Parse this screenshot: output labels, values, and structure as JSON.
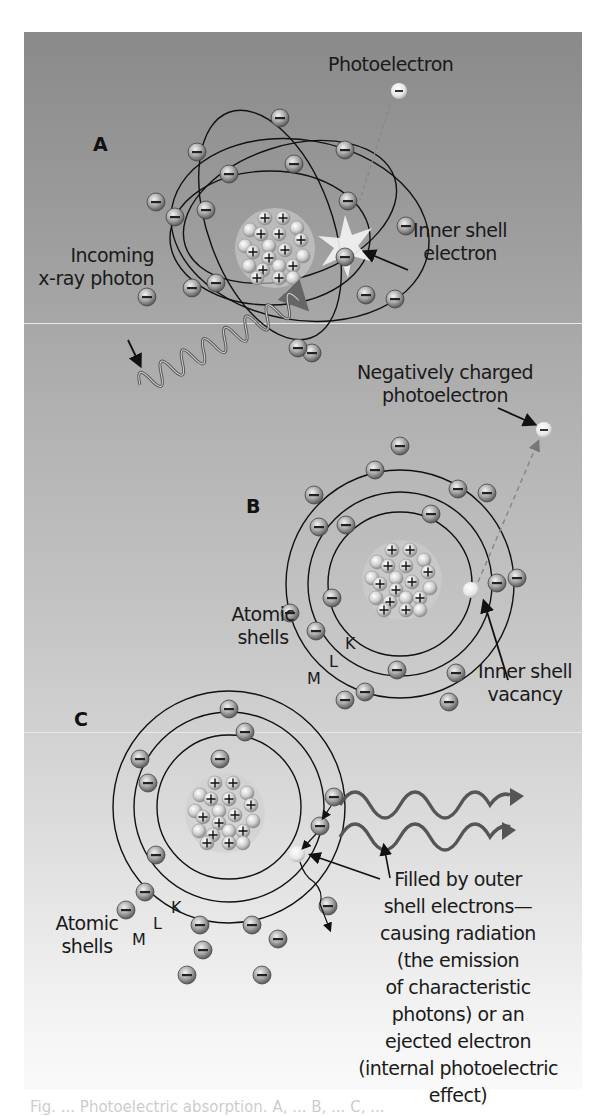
{
  "figure": {
    "panels": [
      {
        "id": "A",
        "labels": {
          "photoelectron": "Photoelectron",
          "inner_shell_electron": [
            "Inner shell",
            "electron"
          ],
          "incoming_photon": [
            "Incoming",
            "x-ray photon"
          ]
        }
      },
      {
        "id": "B",
        "labels": {
          "photoelectron": [
            "Negatively charged",
            "photoelectron"
          ],
          "atomic_shells": [
            "Atomic",
            "shells"
          ],
          "shell_letters": [
            "K",
            "L",
            "M"
          ],
          "vacancy": [
            "Inner shell",
            "vacancy"
          ]
        }
      },
      {
        "id": "C",
        "labels": {
          "atomic_shells": [
            "Atomic",
            "shells"
          ],
          "shell_letters": [
            "K",
            "L",
            "M"
          ],
          "description": [
            "Filled by outer",
            "shell electrons—",
            "causing radiation",
            "(the emission",
            "of characteristic",
            "photons) or an",
            "ejected electron",
            "(internal photoelectric",
            "effect)"
          ]
        }
      }
    ],
    "symbols": {
      "electron": "−",
      "proton": "+"
    },
    "colors": {
      "background_top": "#8a8a8a",
      "background_bottom": "#fafafa",
      "orbit_line": "#111111",
      "electron_fill": "#9a9a9a",
      "nucleus_fill": "#d8d8d8",
      "wave": "#555555"
    },
    "caption_partial": "Fig. ... Photoelectric absorption. A, ... B, ... C, ..."
  }
}
